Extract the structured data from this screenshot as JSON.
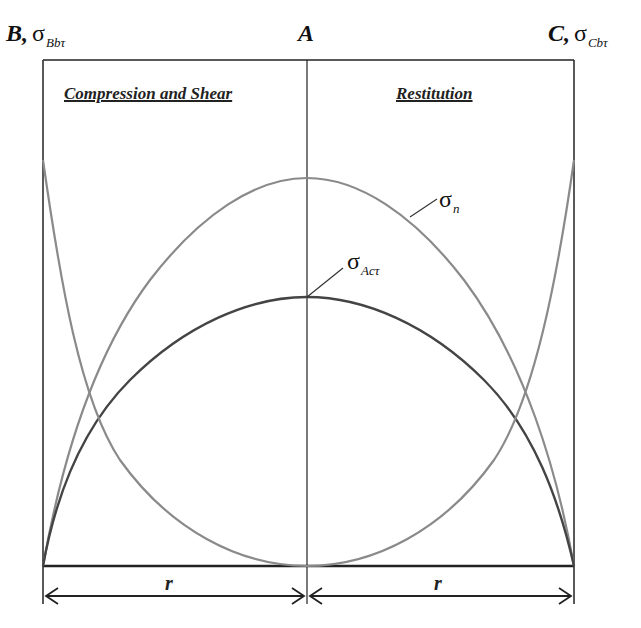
{
  "diagram": {
    "points": {
      "B": {
        "name": "B",
        "sigma": "σ",
        "sub": "Bbτ"
      },
      "A": {
        "name": "A"
      },
      "C": {
        "name": "C",
        "sigma": "σ",
        "sub": "Cbτ"
      }
    },
    "regions": {
      "left": "Compression and Shear",
      "right": "Restitution"
    },
    "curve_labels": {
      "sigma_n": {
        "sigma": "σ",
        "sub": "n"
      },
      "sigma_act": {
        "sigma": "σ",
        "sub": "Acτ"
      }
    },
    "dimensions": {
      "left": "r",
      "right": "r"
    },
    "colors": {
      "frame": "#222222",
      "sigma_n": "#8a8a8a",
      "sigma_act": "#444444",
      "sigma_boundary": "#8a8a8a"
    }
  }
}
